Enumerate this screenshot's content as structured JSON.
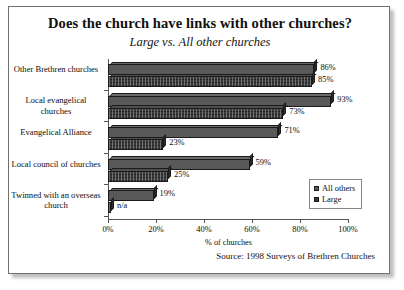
{
  "chart_data": {
    "type": "bar",
    "orientation": "horizontal",
    "title": "Does the church have links with other churches?",
    "subtitle": "Large vs. All other churches",
    "xlabel": "% of churches",
    "ylabel": "",
    "xlim": [
      0,
      100
    ],
    "xticks": [
      "0%",
      "20%",
      "40%",
      "60%",
      "80%",
      "100%"
    ],
    "grid": false,
    "legend_position": "inside-bottom-right",
    "source": "Source: 1998 Surveys of Brethren Churches",
    "categories": [
      "Other Brethren churches",
      "Local evangelical churches",
      "Evangelical Alliance",
      "Local council of churches",
      "Twinned with an overseas church"
    ],
    "series": [
      {
        "name": "All others",
        "color": "#595959",
        "values": [
          86,
          93,
          71,
          59,
          19
        ],
        "labels": [
          "86%",
          "93%",
          "71%",
          "59%",
          "19%"
        ]
      },
      {
        "name": "Large",
        "color": "#3a3a3a",
        "values": [
          85,
          73,
          23,
          25,
          0
        ],
        "labels": [
          "85%",
          "73%",
          "23%",
          "25%",
          "n/a"
        ]
      }
    ]
  },
  "legend": {
    "items": [
      {
        "label": "All others"
      },
      {
        "label": "Large"
      }
    ]
  }
}
